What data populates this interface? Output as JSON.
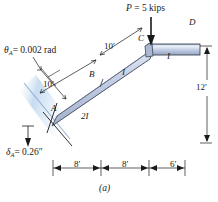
{
  "figure": {
    "caption": "(a)",
    "background_color": "#ffffff",
    "line_color": "#1a1a1a"
  },
  "annotations": {
    "rotation": {
      "symbol": "θ",
      "subscript": "A",
      "equals_value": "= 0.002 rad",
      "full": "θA = 0.002 rad"
    },
    "deflection": {
      "symbol": "δ",
      "subscript": "A",
      "equals_value": "= 0.26″",
      "full": "δA = 0.26″"
    },
    "load": {
      "label": "P = 5 kips",
      "symbol": "P",
      "value": "5",
      "units": "kips",
      "direction": "down"
    }
  },
  "joints": [
    {
      "name": "A"
    },
    {
      "name": "B"
    },
    {
      "name": "C"
    },
    {
      "name": "D"
    }
  ],
  "members": {
    "ab": {
      "length_label": "10′",
      "stiffness_label": "2I"
    },
    "bc": {
      "length_label": "10′",
      "stiffness_label": "I"
    },
    "cd": {
      "stiffness_label": "I"
    }
  },
  "dimensions": {
    "vertical": "12′",
    "horizontal": [
      "8′",
      "8′",
      "6′"
    ]
  },
  "colors": {
    "beam_light": "#d8e0f0",
    "beam_mid": "#b6c3dd",
    "beam_dark": "#8e9db9",
    "beam_outline": "#3d4656",
    "wall_glow": "#cfe0f2"
  }
}
